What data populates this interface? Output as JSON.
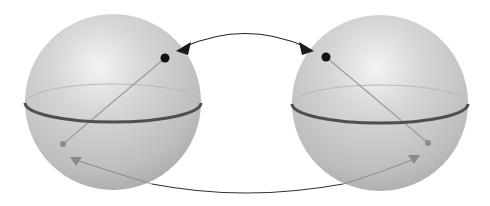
{
  "diagram": {
    "title": "",
    "description": "Two Bloch spheres with state vectors; black states exchanged by a double-headed arrow on top, gray states linked by a curve below",
    "colors": {
      "background": "#ffffff",
      "sphere_highlight": "#f2f2f2",
      "sphere_mid": "#cbcbcb",
      "sphere_edge": "#a6a6a6",
      "equator_front": "#4f4f4f",
      "equator_back": "#b4b4b4",
      "state_vector_line": "#9a9a9a",
      "black_state": "#111111",
      "gray_state": "#8c8c8c",
      "arrow": "#222222",
      "gray_arrow": "#8a8a8a"
    },
    "spheres": [
      {
        "name": "left-sphere",
        "cx": 113,
        "cy": 102,
        "r": 88,
        "equator": {
          "ry": 19
        },
        "black_state": {
          "x": 165,
          "y": 58
        },
        "gray_state": {
          "x": 63,
          "y": 144
        }
      },
      {
        "name": "right-sphere",
        "cx": 380,
        "cy": 103,
        "r": 88,
        "equator": {
          "ry": 19
        },
        "black_state": {
          "x": 326,
          "y": 57
        },
        "gray_state": {
          "x": 428,
          "y": 143
        }
      }
    ],
    "connectors": [
      {
        "name": "top-double-arrow",
        "style": "black, double-headed",
        "from": [
          178,
          50
        ],
        "to": [
          312,
          50
        ]
      },
      {
        "name": "bottom-curve",
        "style": "black line, gray arrowheads inside spheres",
        "from": [
          72,
          160
        ],
        "to": [
          418,
          159
        ]
      }
    ]
  }
}
